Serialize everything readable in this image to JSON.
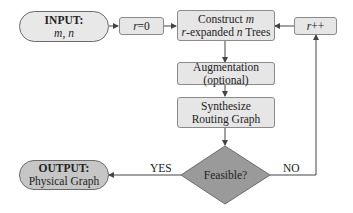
{
  "diagram": {
    "input": {
      "title": "INPUT:",
      "params": "m, n"
    },
    "init": {
      "var": "r",
      "rest": "=0"
    },
    "construct": {
      "line1_pre": "Construct ",
      "line1_var": "m",
      "line2_var": "r",
      "line2_mid": "-expanded ",
      "line2_var2": "n",
      "line2_post": " Trees"
    },
    "increment": {
      "var": "r",
      "rest": "++"
    },
    "augmentation": {
      "line1": "Augmentation",
      "line2": "(optional)"
    },
    "synthesize": {
      "line1": "Synthesize",
      "line2": "Routing Graph"
    },
    "decision": {
      "label": "Feasible?"
    },
    "yes_label": "YES",
    "no_label": "NO",
    "output": {
      "title": "OUTPUT:",
      "value": "Physical Graph"
    }
  },
  "colors": {
    "box_fill": "#e6e6e6",
    "input_fill": "#e8e8e8",
    "output_fill": "#c6c6c6",
    "diamond_fill": "#9a9a9a",
    "line": "#444444"
  }
}
